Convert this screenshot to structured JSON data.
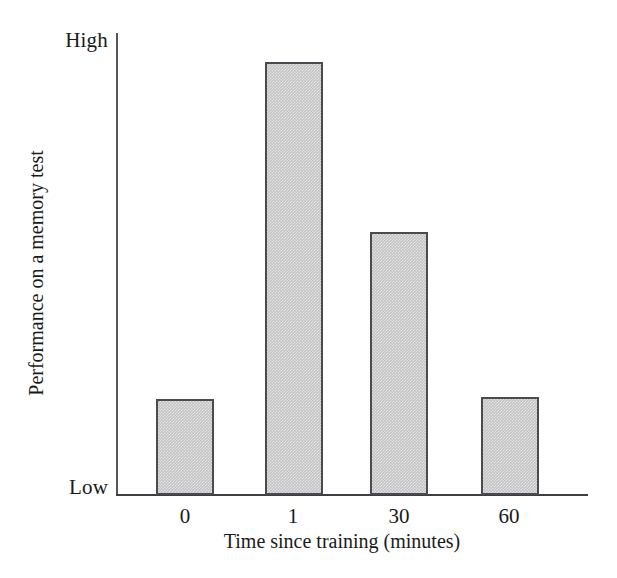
{
  "chart_data": {
    "type": "bar",
    "title": "",
    "xlabel": "Time since training (minutes)",
    "ylabel": "Performance on a memory test",
    "categories": [
      "0",
      "1",
      "30",
      "60"
    ],
    "values": [
      21,
      95,
      58,
      22
    ],
    "ylim": [
      0,
      100
    ],
    "ytick_labels": [
      "Low",
      "High"
    ],
    "ytick_values": [
      0,
      100
    ],
    "grid": false,
    "legend": null,
    "series": [
      {
        "name": "Performance",
        "values": [
          21,
          95,
          58,
          22
        ]
      }
    ],
    "bar_color": "#c3c3c3",
    "bar_border_color": "#4a4a50",
    "axis_color": "#3d3d42",
    "background": "#ffffff",
    "annotations": []
  },
  "axes": {
    "y_high_label": "High",
    "y_low_label": "Low",
    "y_title": "Performance on a memory test",
    "x_title": "Time since training (minutes)",
    "x_ticks": [
      {
        "label": "0",
        "center_px": 185
      },
      {
        "label": "1",
        "center_px": 293
      },
      {
        "label": "30",
        "center_px": 399
      },
      {
        "label": "60",
        "center_px": 509
      }
    ]
  },
  "bars": [
    {
      "label": "0",
      "left_px": 156,
      "top_px": 399,
      "width_px": 58,
      "height_px": 96,
      "value": 21
    },
    {
      "label": "1",
      "left_px": 265,
      "top_px": 62,
      "width_px": 58,
      "height_px": 433,
      "value": 95
    },
    {
      "label": "30",
      "left_px": 370,
      "top_px": 232,
      "width_px": 58,
      "height_px": 263,
      "value": 58
    },
    {
      "label": "60",
      "left_px": 481,
      "top_px": 397,
      "width_px": 58,
      "height_px": 98,
      "value": 22
    }
  ]
}
